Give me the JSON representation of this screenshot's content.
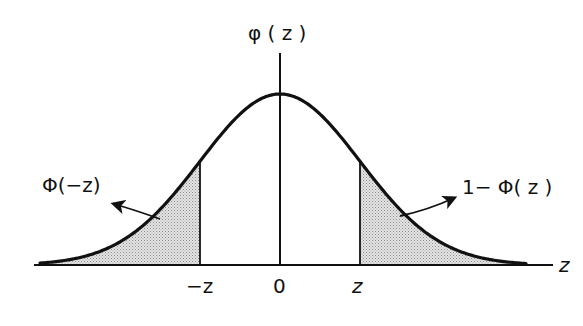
{
  "diagram": {
    "y_axis_label": "φ ( z )",
    "x_axis_label": "z",
    "ticks": [
      {
        "label": "−z",
        "value": -1
      },
      {
        "label": "0",
        "value": 0
      },
      {
        "label": "z",
        "value": 1
      }
    ],
    "left_region_label": "Φ(−z)",
    "right_region_label": "1− Φ( z )",
    "colors": {
      "curve": "#111111",
      "axis": "#111111",
      "shading": "#c8c8c8"
    }
  },
  "chart_data": {
    "type": "area",
    "title": "",
    "xlabel": "z",
    "ylabel": "φ(z)",
    "curve": "standard normal density",
    "x_range": [
      -3,
      3
    ],
    "shaded_regions": [
      {
        "from": -3,
        "to": -1,
        "label": "Φ(−z)"
      },
      {
        "from": 1,
        "to": 3,
        "label": "1−Φ(z)"
      }
    ],
    "tick_labels": [
      "−z",
      "0",
      "z"
    ],
    "grid": false
  }
}
